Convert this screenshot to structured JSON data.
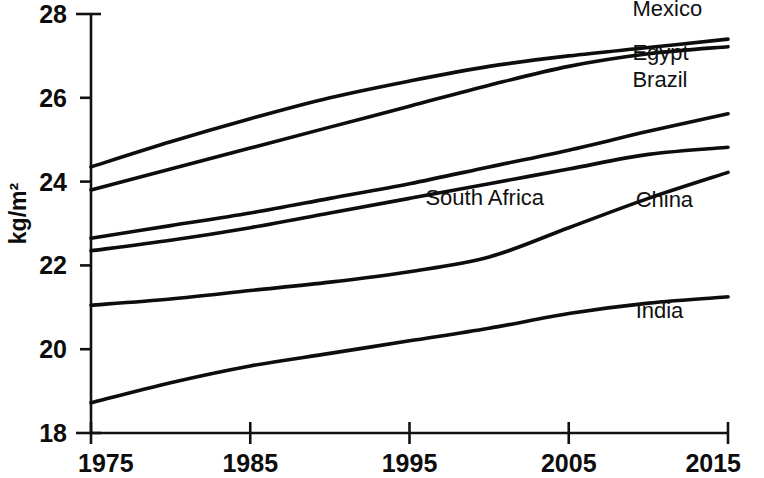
{
  "chart_data": {
    "type": "line",
    "title": "",
    "subtitle": "",
    "xlabel": "",
    "ylabel": "kg/m2",
    "ylabel_display": "kg/m²",
    "xlim": [
      1975,
      2015
    ],
    "ylim": [
      18,
      28
    ],
    "grid": false,
    "legend_position": "inline-right",
    "x_ticks": [
      "1975",
      "1985",
      "1995",
      "2005",
      "2015"
    ],
    "x_tick_values": [
      1975,
      1985,
      1995,
      2005,
      2015
    ],
    "y_ticks": [
      "18",
      "20",
      "22",
      "24",
      "26",
      "28"
    ],
    "y_tick_values": [
      18,
      20,
      22,
      24,
      26,
      28
    ],
    "x": [
      1975,
      1980,
      1985,
      1990,
      1995,
      2000,
      2005,
      2010,
      2015
    ],
    "series": [
      {
        "name": "Mexico",
        "label": "Mexico",
        "color": "#0d0d0d",
        "label_x": 2009,
        "label_y": 27.95,
        "values": [
          24.35,
          24.95,
          25.5,
          26.0,
          26.4,
          26.75,
          27.0,
          27.2,
          27.4
        ]
      },
      {
        "name": "Egypt",
        "label": "Egypt",
        "color": "#0d0d0d",
        "label_x": 2009,
        "label_y": 26.9,
        "values": [
          23.8,
          24.3,
          24.8,
          25.3,
          25.8,
          26.3,
          26.75,
          27.05,
          27.22
        ]
      },
      {
        "name": "Brazil",
        "label": "Brazil",
        "color": "#0d0d0d",
        "label_x": 2009,
        "label_y": 26.25,
        "values": [
          22.65,
          22.95,
          23.25,
          23.6,
          23.95,
          24.35,
          24.75,
          25.2,
          25.62
        ]
      },
      {
        "name": "South Africa",
        "label": "South Africa",
        "color": "#0d0d0d",
        "label_x": 1996,
        "label_y": 23.45,
        "values": [
          22.35,
          22.6,
          22.9,
          23.25,
          23.6,
          23.95,
          24.3,
          24.65,
          24.82
        ]
      },
      {
        "name": "China",
        "label": "China",
        "color": "#0d0d0d",
        "label_x": 2009.2,
        "label_y": 23.4,
        "values": [
          21.05,
          21.2,
          21.4,
          21.6,
          21.85,
          22.2,
          22.9,
          23.6,
          24.22
        ]
      },
      {
        "name": "India",
        "label": "India",
        "color": "#0d0d0d",
        "label_x": 2009.2,
        "label_y": 20.75,
        "values": [
          18.72,
          19.2,
          19.6,
          19.9,
          20.2,
          20.5,
          20.85,
          21.1,
          21.25
        ]
      }
    ]
  }
}
